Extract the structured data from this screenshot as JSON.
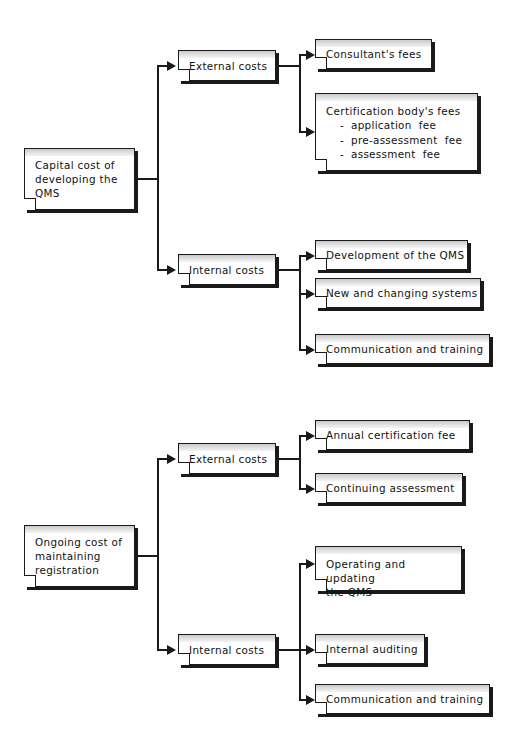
{
  "document": {
    "type": "tree-diagram",
    "background_color": "#ffffff",
    "line_color": "#1a1a1a",
    "box_fill_color": "#ffffff",
    "box_header_band_color": "#d6d6d6",
    "text_color": "#111111"
  },
  "diagrams": [
    {
      "id": "capital-cost",
      "root": {
        "label": "Capital cost of\ndeveloping the\nQMS"
      },
      "branches": [
        {
          "id": "capital-external",
          "label": "External  costs",
          "children": [
            {
              "id": "consultants-fees",
              "label": "Consultant's  fees"
            },
            {
              "id": "certification-body-fees",
              "label": "Certification  body's  fees",
              "items": [
                "application  fee",
                "pre-assessment  fee",
                "assessment  fee"
              ]
            }
          ]
        },
        {
          "id": "capital-internal",
          "label": "Internal  costs",
          "children": [
            {
              "id": "development-of-qms",
              "label": "Development  of  the  QMS"
            },
            {
              "id": "new-and-changing-systems",
              "label": "New  and  changing  systems"
            },
            {
              "id": "communication-and-training-capital",
              "label": "Communication  and  training"
            }
          ]
        }
      ]
    },
    {
      "id": "ongoing-cost",
      "root": {
        "label": "Ongoing cost of\nmaintaining\nregistration"
      },
      "branches": [
        {
          "id": "ongoing-external",
          "label": "External  costs",
          "children": [
            {
              "id": "annual-certification-fee",
              "label": "Annual  certification  fee"
            },
            {
              "id": "continuing-assessment",
              "label": "Continuing  assessment"
            }
          ]
        },
        {
          "id": "ongoing-internal",
          "label": "Internal  costs",
          "children": [
            {
              "id": "operating-and-updating-qms",
              "label": "Operating and updating\nthe QMS"
            },
            {
              "id": "internal-auditing",
              "label": "Internal  auditing"
            },
            {
              "id": "communication-and-training-ongoing",
              "label": "Communication  and  training"
            }
          ]
        }
      ]
    }
  ],
  "list_bullet": "-"
}
